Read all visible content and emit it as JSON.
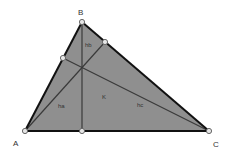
{
  "diagram": {
    "type": "triangle-altitudes",
    "colors": {
      "fill": "#8f8f8f",
      "edge": "#111111",
      "altitude": "#3a3a3a",
      "point_fill": "#e6e6e6",
      "point_stroke": "#666666",
      "label": "#333333"
    },
    "vertices": {
      "A": {
        "label": "A",
        "x": 25,
        "y": 131
      },
      "B": {
        "label": "B",
        "x": 82,
        "y": 22
      },
      "C": {
        "label": "C",
        "x": 209,
        "y": 131
      }
    },
    "feet": {
      "on_AC": {
        "x": 82,
        "y": 131
      },
      "on_BC": {
        "x": 105,
        "y": 42
      },
      "on_AB": {
        "x": 63,
        "y": 58
      }
    },
    "labels": {
      "A": "A",
      "B": "B",
      "C": "C",
      "h_b": "hb",
      "h_a": "ha",
      "h_c": "hc",
      "K": "K"
    }
  }
}
